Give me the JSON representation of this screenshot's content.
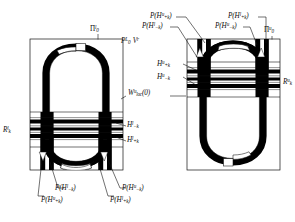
{
  "figure": {
    "title": "",
    "boxes": [
      {
        "id": "left-box",
        "label_plain": "Π₀ˡ",
        "corner_label": "Pi-0-l"
      },
      {
        "id": "right-box",
        "label_plain": "Π₀ᵘ",
        "corner_label": "Pi-0-u"
      }
    ]
  },
  "labels": {
    "pi_left": {
      "base": "П",
      "sup": "l",
      "sub": "0"
    },
    "pi_right": {
      "base": "П",
      "sup": "u",
      "sub": "0"
    },
    "pv": {
      "text": "P",
      "sup": "L",
      "sub": "0",
      "text2": "V",
      "sup2": "r"
    },
    "w_loc": {
      "base": "W",
      "sup": "u",
      "sub": "loc",
      "tail": "(0)"
    },
    "r_left": {
      "base": "R",
      "sup": "l",
      "sub": "k"
    },
    "r_right": {
      "base": "R",
      "sup": "u",
      "sub": "k"
    },
    "h_l_minus": {
      "base": "H",
      "sup": "l",
      "sub": "−k"
    },
    "h_l_plus": {
      "base": "H",
      "sup": "l",
      "sub": "+k"
    },
    "h_u_plus": {
      "base": "H",
      "sup": "u",
      "sub": "+k"
    },
    "h_u_minus": {
      "base": "H",
      "sup": "u",
      "sub": "−k"
    },
    "p_hu_plus": {
      "pre": "P(",
      "base": "H",
      "sup": "u",
      "sub": "+k",
      "post": ")"
    },
    "p_hl_minus": {
      "pre": "P(",
      "base": "H",
      "sup": "l",
      "sub": "−k",
      "post": ")"
    },
    "p_hl_plus": {
      "pre": "P(",
      "base": "H",
      "sup": "l",
      "sub": "+k",
      "post": ")"
    },
    "p_hu_minus": {
      "pre": "P(",
      "base": "H",
      "sup": "u",
      "sub": "−k",
      "post": ")"
    }
  },
  "label_text": {
    "pi_left": "П",
    "pi_left_sup": "l",
    "pi_left_sub": "0",
    "pi_right": "П",
    "pi_right_sup": "u",
    "pi_right_sub": "0",
    "pv_p": "P",
    "pv_p_sup": "L",
    "pv_p_sub": "0",
    "pv_v": "V",
    "pv_v_sup": "r",
    "w": "W",
    "w_sup": "u",
    "w_sub": "loc",
    "w_tail": "(0)",
    "r": "R",
    "r_l_sup": "l",
    "r_u_sup": "u",
    "r_sub": "k",
    "h": "H",
    "sup_l": "l",
    "sup_u": "u",
    "sub_minus": "−k",
    "sub_plus": "+k",
    "p_open": "P(",
    "p_close": ")"
  },
  "colors": {
    "ink": "#0d0d0d",
    "line": "#111111",
    "background": "#ffffff",
    "band": "#000000"
  },
  "annotations": {
    "top_right_group": [
      "P(H^u_{+k})",
      "P(H^l_{-k})",
      "P(H^l_{+k})",
      "P(H^u_{-k})"
    ],
    "bottom_left_group": [
      "P(H^l_{-k})",
      "P(H^u_{+k})",
      "P(H^l_{+k})",
      "P(H^u_{-k})"
    ],
    "mid_right_group": [
      "H^u_{+k}",
      "H^u_{-k}"
    ],
    "mid_left_group": [
      "H^l_{-k}",
      "H^l_{+k}"
    ],
    "center": "W^u_{loc}(0)"
  }
}
